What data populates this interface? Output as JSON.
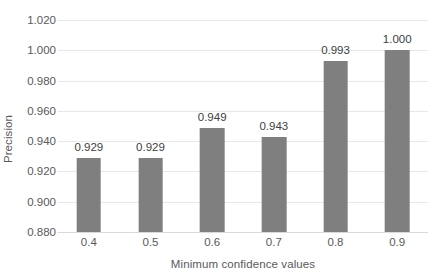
{
  "chart_data": {
    "type": "bar",
    "title": "",
    "xlabel": "Minimum confidence values",
    "ylabel": "Precision",
    "categories": [
      "0.4",
      "0.5",
      "0.6",
      "0.7",
      "0.8",
      "0.9"
    ],
    "values": [
      0.929,
      0.929,
      0.949,
      0.943,
      0.993,
      1.0
    ],
    "value_labels": [
      "0.929",
      "0.929",
      "0.949",
      "0.943",
      "0.993",
      "1.000"
    ],
    "ylim": [
      0.88,
      1.02
    ],
    "ytick_labels": [
      "1.020",
      "1.000",
      "0.980",
      "0.960",
      "0.940",
      "0.920",
      "0.900",
      "0.880"
    ],
    "ytick_values": [
      1.02,
      1.0,
      0.98,
      0.96,
      0.94,
      0.92,
      0.9,
      0.88
    ],
    "grid": true,
    "legend": false,
    "bar_color": "#7f7f7f",
    "gridline_color": "#e8e8e8",
    "axis_text_color": "#595959",
    "label_text_color": "#404040",
    "background_color": "#ffffff"
  }
}
